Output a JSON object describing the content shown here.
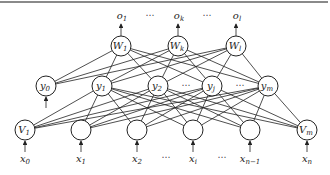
{
  "diagram": {
    "type": "neural-network",
    "layers": {
      "output": {
        "labels": [
          {
            "base": "o",
            "sub": "1"
          },
          {
            "base": "o",
            "sub": "k"
          },
          {
            "base": "o",
            "sub": "l"
          }
        ],
        "nodes": [
          {
            "base": "W",
            "sub": "1"
          },
          {
            "base": "W",
            "sub": "k"
          },
          {
            "base": "W",
            "sub": "l"
          }
        ]
      },
      "hidden": {
        "nodes": [
          {
            "base": "y",
            "sub": "0"
          },
          {
            "base": "y",
            "sub": "1"
          },
          {
            "base": "y",
            "sub": "2"
          },
          {
            "base": "y",
            "sub": "j"
          },
          {
            "base": "y",
            "sub": "m"
          }
        ]
      },
      "input": {
        "nodes": [
          {
            "base": "V",
            "sub": "1"
          },
          {
            "base": "",
            "sub": ""
          },
          {
            "base": "",
            "sub": ""
          },
          {
            "base": "",
            "sub": ""
          },
          {
            "base": "",
            "sub": ""
          },
          {
            "base": "V",
            "sub": "m"
          }
        ],
        "labels": [
          {
            "base": "x",
            "sub": "0"
          },
          {
            "base": "x",
            "sub": "1"
          },
          {
            "base": "x",
            "sub": "2"
          },
          {
            "base": "x",
            "sub": "i"
          },
          {
            "base": "x",
            "sub": "n−1"
          },
          {
            "base": "x",
            "sub": "n"
          }
        ]
      }
    },
    "ellipsis": "⋯"
  }
}
